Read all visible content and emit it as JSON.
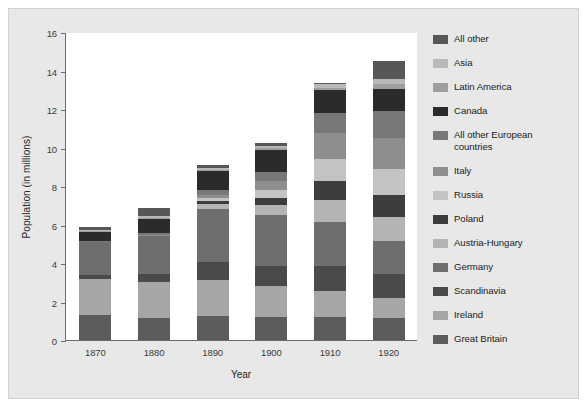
{
  "chart_data": {
    "type": "bar",
    "subtype": "stacked-bar",
    "title": "",
    "xlabel": "Year",
    "ylabel": "Population (in millions)",
    "ylim": [
      0,
      16
    ],
    "yticks": [
      0,
      2,
      4,
      6,
      8,
      10,
      12,
      14,
      16
    ],
    "grid": false,
    "legend_position": "right",
    "categories": [
      "1870",
      "1880",
      "1890",
      "1900",
      "1910",
      "1920"
    ],
    "series": [
      {
        "name": "Great Britain",
        "color": "#5c5c5c",
        "values": [
          1.3,
          1.15,
          1.25,
          1.17,
          1.22,
          1.14
        ]
      },
      {
        "name": "Ireland",
        "color": "#a6a6a6",
        "values": [
          1.86,
          1.85,
          1.87,
          1.62,
          1.35,
          1.04
        ]
      },
      {
        "name": "Scandinavia",
        "color": "#4a4a4a",
        "values": [
          0.24,
          0.44,
          0.93,
          1.07,
          1.25,
          1.25
        ]
      },
      {
        "name": "Germany",
        "color": "#6e6e6e",
        "values": [
          1.69,
          1.97,
          2.78,
          2.66,
          2.31,
          1.69
        ]
      },
      {
        "name": "Austria-Hungary",
        "color": "#b4b4b4",
        "values": [
          0.0,
          0.0,
          0.24,
          0.49,
          1.17,
          1.25
        ]
      },
      {
        "name": "Poland",
        "color": "#3d3d3d",
        "values": [
          0.0,
          0.0,
          0.15,
          0.39,
          0.94,
          1.14
        ]
      },
      {
        "name": "Russia",
        "color": "#c3c3c3",
        "values": [
          0.0,
          0.0,
          0.15,
          0.39,
          1.18,
          1.4
        ]
      },
      {
        "name": "Italy",
        "color": "#8e8e8e",
        "values": [
          0.0,
          0.05,
          0.19,
          0.49,
          1.34,
          1.61
        ]
      },
      {
        "name": "All other European countries",
        "color": "#787878",
        "values": [
          0.05,
          0.09,
          0.24,
          0.44,
          1.02,
          1.37
        ]
      },
      {
        "name": "Canada",
        "color": "#2b2b2b",
        "values": [
          0.49,
          0.73,
          0.98,
          1.18,
          1.21,
          1.14
        ]
      },
      {
        "name": "Latin America",
        "color": "#9e9e9e",
        "values": [
          0.03,
          0.04,
          0.05,
          0.08,
          0.12,
          0.28
        ]
      },
      {
        "name": "Asia",
        "color": "#b9b9b9",
        "values": [
          0.06,
          0.11,
          0.11,
          0.12,
          0.19,
          0.24
        ]
      },
      {
        "name": "All other",
        "color": "#575757",
        "values": [
          0.18,
          0.42,
          0.14,
          0.13,
          0.05,
          0.94
        ]
      }
    ],
    "legend_order_top_to_bottom": [
      "All other",
      "Asia",
      "Latin America",
      "Canada",
      "All other European countries",
      "Italy",
      "Russia",
      "Poland",
      "Austria-Hungary",
      "Germany",
      "Scandinavia",
      "Ireland",
      "Great Britain"
    ],
    "totals": [
      5.9,
      6.85,
      9.1,
      10.25,
      13.35,
      14.5
    ]
  },
  "colors": {
    "figure_background": "#e8e8e8",
    "plot_background": "#ffffff",
    "axis": "#6b6b6b",
    "text": "#262626"
  }
}
